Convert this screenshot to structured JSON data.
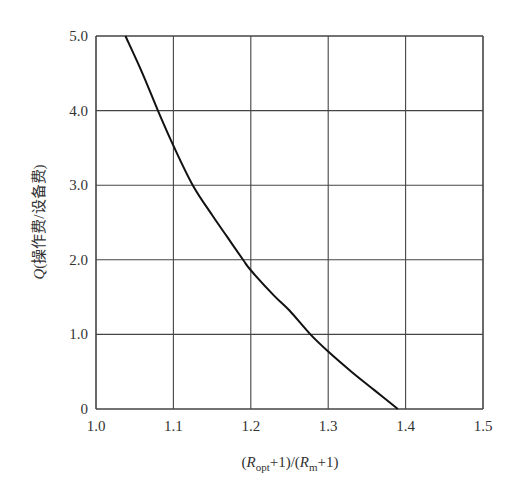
{
  "chart_data": {
    "type": "line",
    "title": "",
    "xlabel": "(R_opt+1)/(R_m+1)",
    "xlabel_parts": {
      "open": "(",
      "r1": "R",
      "sub1": "opt",
      "mid": "+1)/(",
      "r2": "R",
      "sub2": "m",
      "close": "+1)"
    },
    "ylabel": "Q(操作费/设备费)",
    "ylabel_parts": {
      "q": "Q",
      "rest": "(操作费/设备费)"
    },
    "xlim": [
      1.0,
      1.5
    ],
    "ylim": [
      0,
      5.0
    ],
    "x_ticks": [
      "1.0",
      "1.1",
      "1.2",
      "1.3",
      "1.4",
      "1.5"
    ],
    "y_ticks": [
      "0",
      "1.0",
      "2.0",
      "3.0",
      "4.0",
      "5.0"
    ],
    "grid": true,
    "legend": null,
    "series": [
      {
        "name": "Q curve",
        "x": [
          1.038,
          1.06,
          1.08,
          1.1,
          1.125,
          1.15,
          1.17,
          1.19,
          1.2,
          1.23,
          1.25,
          1.277,
          1.3,
          1.33,
          1.36,
          1.39
        ],
        "y": [
          5.0,
          4.5,
          4.0,
          3.53,
          3.0,
          2.6,
          2.3,
          2.0,
          1.86,
          1.52,
          1.32,
          1.0,
          0.77,
          0.5,
          0.25,
          0.0
        ]
      }
    ]
  }
}
